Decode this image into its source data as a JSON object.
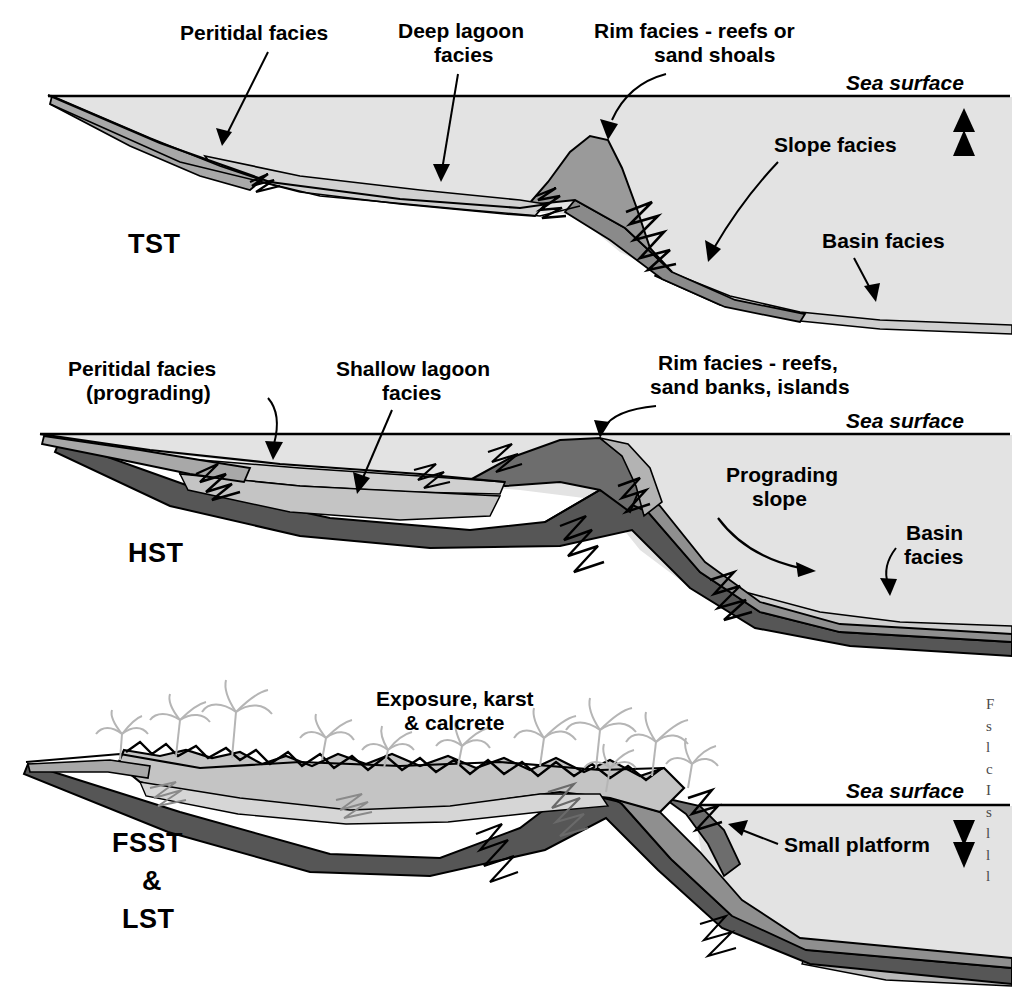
{
  "figure": {
    "background_color": "#ffffff"
  },
  "palette": {
    "water": "#e3e3e3",
    "peritidal": "#a8a8a8",
    "lagoon": "#d0d0d0",
    "rim": "#9a9a9a",
    "slope": "#8a8a8a",
    "basin": "#cfcfcf",
    "dark_unit": "#565656",
    "mid_unit": "#8f8f8f",
    "light_unit": "#c4c4c4",
    "outline": "#000000",
    "palm": "#b5b5b5"
  },
  "panels": [
    {
      "id": "tst",
      "tract_label": "TST",
      "tract_label_full": "Transgressive Systems Tract",
      "sea_surface_label": "Sea surface",
      "sea_level_arrow": "up-double-arrow",
      "sea_level_direction": "rising",
      "labels": [
        {
          "id": "peritidal",
          "text": "Peritidal facies",
          "lines": [
            "Peritidal facies"
          ]
        },
        {
          "id": "deep-lagoon",
          "text": "Deep lagoon facies",
          "lines": [
            "Deep lagoon",
            "facies"
          ]
        },
        {
          "id": "rim",
          "text": "Rim facies - reefs or sand shoals",
          "lines": [
            "Rim facies - reefs or",
            "sand shoals"
          ]
        },
        {
          "id": "slope",
          "text": "Slope facies",
          "lines": [
            "Slope facies"
          ]
        },
        {
          "id": "basin",
          "text": "Basin facies",
          "lines": [
            "Basin facies"
          ]
        }
      ]
    },
    {
      "id": "hst",
      "tract_label": "HST",
      "tract_label_full": "Highstand Systems Tract",
      "sea_surface_label": "Sea surface",
      "sea_level_arrow": "none",
      "sea_level_direction": "stable",
      "labels": [
        {
          "id": "peritidal",
          "text": "Peritidal facies (prograding)",
          "lines": [
            "Peritidal facies",
            "(prograding)"
          ]
        },
        {
          "id": "shallow-lagoon",
          "text": "Shallow lagoon facies",
          "lines": [
            "Shallow lagoon",
            "facies"
          ]
        },
        {
          "id": "rim",
          "text": "Rim facies - reefs, sand banks, islands",
          "lines": [
            "Rim facies - reefs,",
            "sand banks, islands"
          ]
        },
        {
          "id": "prograding-slope",
          "text": "Prograding slope",
          "lines": [
            "Prograding",
            "slope"
          ]
        },
        {
          "id": "basin",
          "text": "Basin facies",
          "lines": [
            "Basin",
            "facies"
          ]
        }
      ]
    },
    {
      "id": "fsst-lst",
      "tract_label": "FSST & LST",
      "tract_label_lines": [
        "FSST",
        "&",
        "LST"
      ],
      "tract_label_full": "Falling Stage Systems Tract and Lowstand Systems Tract",
      "sea_surface_label": "Sea surface",
      "sea_level_arrow": "down-double-arrow",
      "sea_level_direction": "falling",
      "labels": [
        {
          "id": "exposure",
          "text": "Exposure, karst & calcrete",
          "lines": [
            "Exposure, karst",
            "& calcrete"
          ]
        },
        {
          "id": "small-platform",
          "text": "Small platform",
          "lines": [
            "Small platform"
          ]
        }
      ],
      "decorations": {
        "palm_tree_count": 11,
        "karst_surface": true
      }
    }
  ],
  "caption_fragment": {
    "note": "Caption column clipped at right page edge; only line-initial letters visible",
    "lines": [
      "F",
      "s",
      "l",
      "c",
      "I",
      "s",
      "l",
      "l",
      "l"
    ]
  }
}
